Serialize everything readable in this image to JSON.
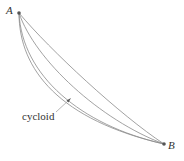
{
  "diagram": {
    "title": "",
    "points": [
      {
        "id": "A",
        "label": "A",
        "x": 19,
        "y": 13
      },
      {
        "id": "B",
        "label": "B",
        "x": 164,
        "y": 144
      }
    ],
    "curves": [
      {
        "id": "curve-1",
        "path": "M19,13 C19,70 60,120 164,144"
      },
      {
        "id": "cycloid",
        "path": "M19,13 C22,75 80,125 164,144"
      },
      {
        "id": "curve-3",
        "path": "M19,13 C35,60 100,120 164,144"
      },
      {
        "id": "curve-4",
        "path": "M19,13 C50,50 120,115 164,144"
      }
    ],
    "annotation": {
      "label": "cycloid",
      "target_curve": "cycloid",
      "arrow_tip": {
        "x": 70,
        "y": 99
      },
      "leader_start": {
        "x": 56,
        "y": 112
      }
    },
    "colors": {
      "curve": "#8a8a8a",
      "text": "#333333",
      "background": "#ffffff"
    }
  }
}
